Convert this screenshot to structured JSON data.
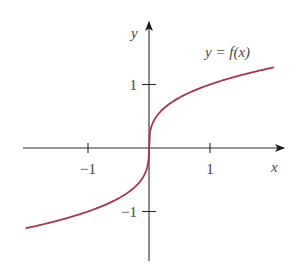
{
  "chart_data": {
    "type": "line",
    "title": "",
    "xlabel": "x",
    "ylabel": "y",
    "xlim": [
      -2.05,
      2.1
    ],
    "ylim": [
      -1.8,
      1.95
    ],
    "grid": false,
    "x_ticks": [
      -1,
      1
    ],
    "x_tick_labels": [
      "−1",
      "1"
    ],
    "y_ticks": [
      1,
      -1
    ],
    "y_tick_labels": [
      "1",
      "−1"
    ],
    "series": [
      {
        "name": "y = f(x)",
        "function": "cube root",
        "x": [
          -2.02,
          -1.5,
          -1,
          -0.64,
          -0.31,
          -0.1,
          0,
          0.1,
          0.31,
          0.64,
          1,
          1.5,
          2.05
        ],
        "values": [
          -1.26,
          -1.14,
          -1,
          -0.86,
          -0.68,
          -0.46,
          0,
          0.46,
          0.68,
          0.86,
          1,
          1.14,
          1.27
        ],
        "color": "#a0384e"
      }
    ],
    "annotations": [
      {
        "text": "y = f(x)",
        "anchor": "upper-right near curve end"
      }
    ]
  }
}
